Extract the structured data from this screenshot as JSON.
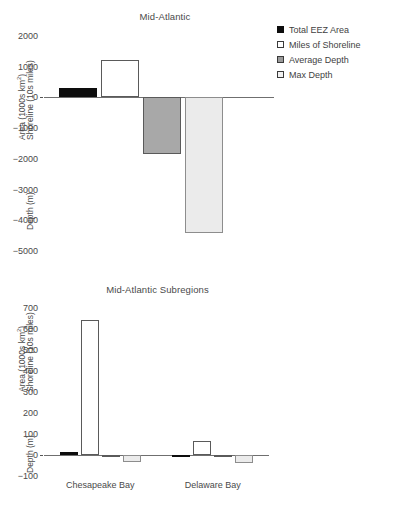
{
  "figure": {
    "background": "#ffffff",
    "text_color": "#444444"
  },
  "legend_series": [
    {
      "label": "Total EEZ Area",
      "swatch": "black-filled-square",
      "color": "#0d0d0d"
    },
    {
      "label": "Miles of Shoreline",
      "swatch": "white-outlined-square",
      "color": "#ffffff"
    },
    {
      "label": "Average Depth",
      "swatch": "gray-filled-square",
      "color": "#a8a8a8"
    },
    {
      "label": "Max Depth",
      "swatch": "light-gray-outlined-square",
      "color": "#ebebeb"
    }
  ],
  "panels": {
    "top": {
      "title": "Mid-Atlantic",
      "ylabel_upper": "Area (1000s km²)",
      "ylabel_upper_line2": "Shoreline (10s miles)",
      "ylabel_lower": "Depth (m)",
      "ticks": [
        "2000",
        "1000",
        "0",
        "−1000",
        "−2000",
        "−3000",
        "−4000",
        "−5000"
      ]
    },
    "bottom": {
      "title": "Mid-Atlantic Subregions",
      "ylabel_upper": "Area (1000s km²)",
      "ylabel_upper_line2": "Shoreline (10s miles)",
      "ylabel_lower": "Depth (m)",
      "ticks": [
        "700",
        "600",
        "500",
        "400",
        "300",
        "200",
        "100",
        "0",
        "−100"
      ],
      "categories": [
        "Chesapeake Bay",
        "Delaware Bay"
      ]
    }
  },
  "chart_data": [
    {
      "type": "bar",
      "title": "Mid-Atlantic",
      "xlabel": "",
      "ylabel": "Area (1000s km²) / Shoreline (10s miles) / Depth (m)",
      "categories": [
        "Mid-Atlantic"
      ],
      "ylim": [
        -5000,
        2000
      ],
      "yticks": [
        2000,
        1000,
        0,
        -1000,
        -2000,
        -3000,
        -4000,
        -5000
      ],
      "grid": false,
      "legend_position": "right",
      "series": [
        {
          "name": "Total EEZ Area",
          "values": [
            300
          ],
          "color": "#0d0d0d"
        },
        {
          "name": "Miles of Shoreline",
          "values": [
            1230
          ],
          "color": "#ffffff"
        },
        {
          "name": "Average Depth",
          "values": [
            -1830
          ],
          "color": "#a8a8a8"
        },
        {
          "name": "Max Depth",
          "values": [
            -4400
          ],
          "color": "#ebebeb"
        }
      ]
    },
    {
      "type": "bar",
      "title": "Mid-Atlantic Subregions",
      "xlabel": "",
      "ylabel": "Area (1000s km²) / Shoreline (10s miles) / Depth (m)",
      "categories": [
        "Chesapeake Bay",
        "Delaware Bay"
      ],
      "ylim": [
        -100,
        700
      ],
      "yticks": [
        700,
        600,
        500,
        400,
        300,
        200,
        100,
        0,
        -100
      ],
      "grid": false,
      "legend_position": "right",
      "series": [
        {
          "name": "Total EEZ Area",
          "values": [
            12,
            2
          ],
          "color": "#0d0d0d"
        },
        {
          "name": "Miles of Shoreline",
          "values": [
            645,
            65
          ],
          "color": "#ffffff"
        },
        {
          "name": "Average Depth",
          "values": [
            -9,
            -6
          ],
          "color": "#a8a8a8"
        },
        {
          "name": "Max Depth",
          "values": [
            -35,
            -40
          ],
          "color": "#ebebeb"
        }
      ]
    }
  ]
}
